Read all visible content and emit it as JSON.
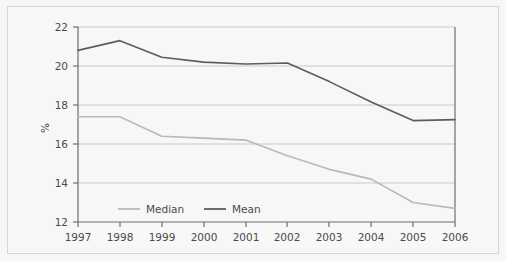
{
  "chart_data": {
    "type": "line",
    "title": "",
    "subtitle": "",
    "xlabel": "",
    "ylabel": "%",
    "categories": [
      "1997",
      "1998",
      "1999",
      "2000",
      "2001",
      "2002",
      "2003",
      "2004",
      "2005",
      "2006"
    ],
    "x": [
      1997,
      1998,
      1999,
      2000,
      2001,
      2002,
      2003,
      2004,
      2005,
      2006
    ],
    "xlim": [
      1997,
      2006
    ],
    "ylim": [
      12,
      22
    ],
    "yticks": [
      12,
      14,
      16,
      18,
      20,
      22
    ],
    "ytick_labels": [
      "12",
      "14",
      "16",
      "18",
      "20",
      "22"
    ],
    "xticks": [
      1997,
      1998,
      1999,
      2000,
      2001,
      2002,
      2003,
      2004,
      2005,
      2006
    ],
    "xtick_labels": [
      "1997",
      "1998",
      "1999",
      "2000",
      "2001",
      "2002",
      "2003",
      "2004",
      "2005",
      "2006"
    ],
    "grid": "horizontal",
    "legend_position": "bottom-inside-left",
    "series": [
      {
        "name": "Median",
        "color": "#b9b9b9",
        "values": [
          17.4,
          17.4,
          16.4,
          16.3,
          16.2,
          15.4,
          14.7,
          14.2,
          13.0,
          12.7
        ]
      },
      {
        "name": "Mean",
        "color": "#5c5c5c",
        "values": [
          20.8,
          21.3,
          20.45,
          20.2,
          20.1,
          20.15,
          19.2,
          18.15,
          17.2,
          17.25
        ]
      }
    ],
    "legend": [
      {
        "label": "Median",
        "color": "#b9b9b9"
      },
      {
        "label": "Mean",
        "color": "#5c5c5c"
      }
    ],
    "colors": {
      "background": "#f7f7f7",
      "frame": "#d6d6d6",
      "axis": "#6e6e6e",
      "gridline": "#c9c9c9",
      "tick_text": "#4b4b4b",
      "median_series": "#b9b9b9",
      "mean_series": "#5c5c5c"
    }
  }
}
